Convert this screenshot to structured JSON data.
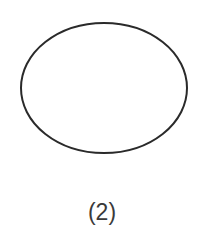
{
  "figure": {
    "label": "(2)",
    "shape": {
      "type": "ellipse",
      "cx": 104,
      "cy": 88,
      "rx": 83,
      "ry": 65,
      "stroke": "#2a2a2a",
      "stroke_width": 2,
      "fill": "none"
    }
  }
}
